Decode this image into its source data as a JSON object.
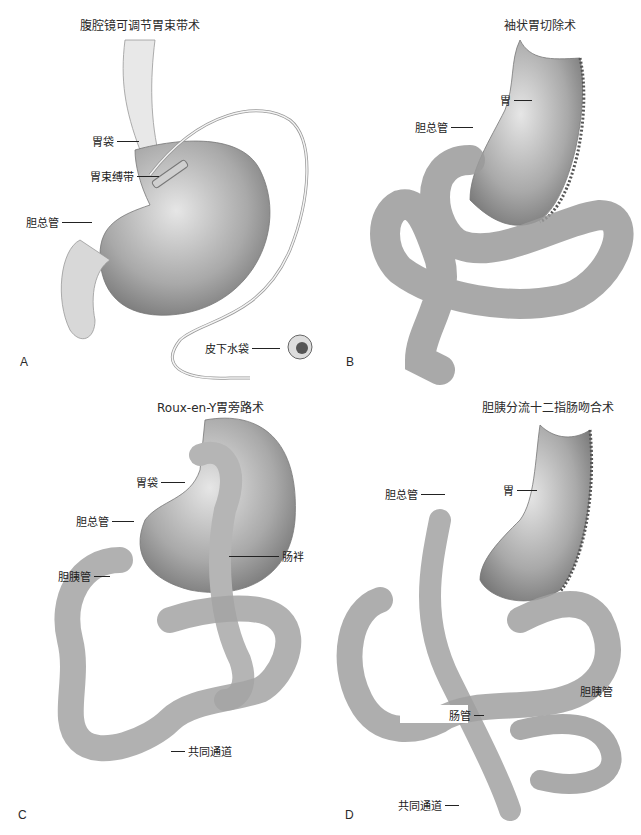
{
  "figure": {
    "caption_visible": "",
    "panels": [
      {
        "letter": "A",
        "title": "腹腔镜可调节胃束带术",
        "labels": [
          "胃袋",
          "胃束缚带",
          "胆总管",
          "皮下水袋"
        ]
      },
      {
        "letter": "B",
        "title": "袖状胃切除术",
        "labels": [
          "胃",
          "胆总管"
        ]
      },
      {
        "letter": "C",
        "title": "Roux-en-Y胃旁路术",
        "labels": [
          "胃袋",
          "胆总管",
          "胆胰管",
          "肠袢",
          "共同通道"
        ]
      },
      {
        "letter": "D",
        "title": "胆胰分流十二指肠吻合术",
        "labels": [
          "胆总管",
          "胃",
          "肠管",
          "胆胰管",
          "共同通道"
        ]
      }
    ]
  }
}
